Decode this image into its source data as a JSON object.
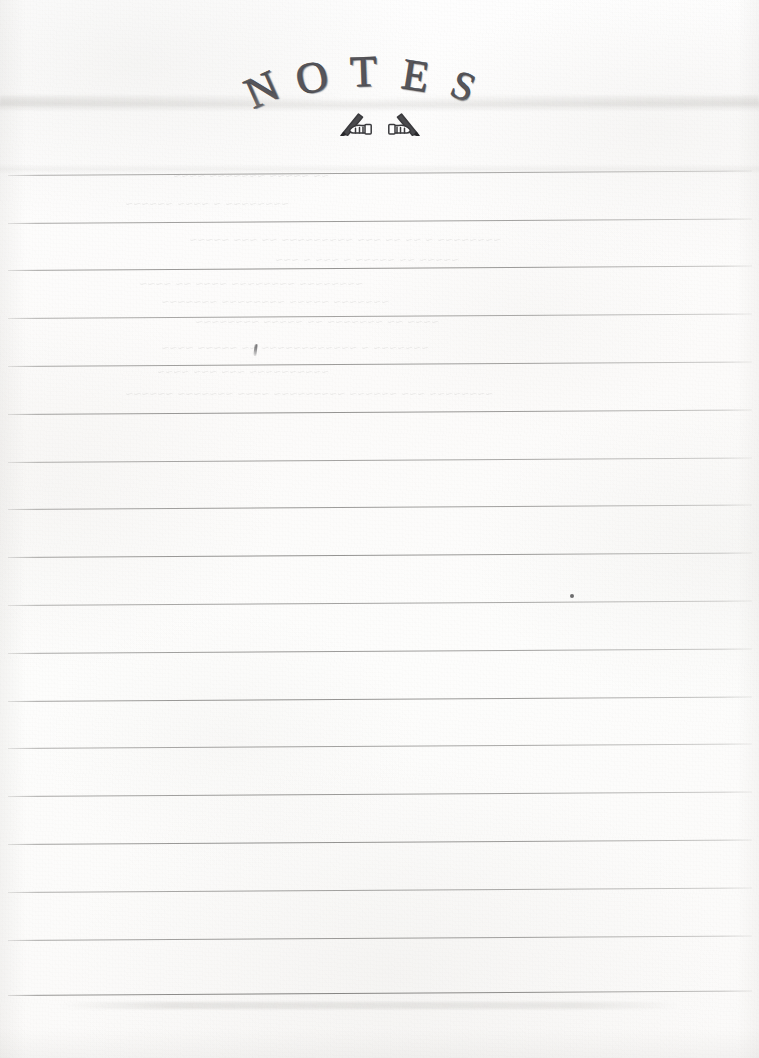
{
  "document": {
    "kind": "scanned-ruled-notepad-page",
    "title_text": "NOTES",
    "title_letters": [
      {
        "char": "N",
        "left": 6,
        "top": 20,
        "size": 44,
        "rotate": -24
      },
      {
        "char": "O",
        "left": 56,
        "top": 8,
        "size": 44,
        "rotate": -13
      },
      {
        "char": "T",
        "left": 110,
        "top": 2,
        "size": 44,
        "rotate": -2
      },
      {
        "char": "E",
        "left": 162,
        "top": 6,
        "size": 44,
        "rotate": 9
      },
      {
        "char": "S",
        "left": 212,
        "top": 18,
        "size": 40,
        "rotate": 22
      }
    ],
    "icons": [
      {
        "name": "hand-writing-pen-icon-left",
        "flipped": false
      },
      {
        "name": "hand-writing-pen-icon-right",
        "flipped": true
      }
    ],
    "page_size": {
      "width": 759,
      "height": 1058
    },
    "colors": {
      "paper": "#fdfdfc",
      "rule_line": "#6e6d6b",
      "title_ink": "#56555a",
      "title_outline": "#3f3f44",
      "stray_mark": "#484848"
    },
    "ruled_lines": {
      "count": 18,
      "first_y": 175,
      "spacing": 47.8,
      "left_x": 8,
      "right_x": 752,
      "skew_degrees": -0.35,
      "note": "faint grey printed rules, full page width, slight scan skew"
    },
    "ruled_line_tops": [
      175,
      223,
      270,
      318,
      366,
      414,
      462,
      509,
      557,
      605,
      653,
      701,
      748,
      796,
      844,
      892,
      940,
      995
    ],
    "writing_content": {
      "has_user_writing": false,
      "note": "page is blank; all lines are empty"
    },
    "artifacts": [
      {
        "name": "pen-tick-mark",
        "x": 254,
        "y": 344,
        "description": "small dark pen tick above a rule"
      },
      {
        "name": "ink-speck",
        "x": 570,
        "y": 594,
        "description": "tiny dark speck"
      },
      {
        "name": "scanner-streak-top",
        "y": 98,
        "description": "faint horizontal scanner band across the page"
      },
      {
        "name": "bottom-smudge",
        "y": 1002,
        "description": "faint grey smudge below last rule"
      }
    ],
    "showthrough": {
      "note": "faint mirrored bleed-through of handwriting from the reverse side of the sheet; illegible",
      "lines": [
        {
          "text": "~~ ~~~~~ ~~~~~~~ ~~~~",
          "x": 430,
          "y": 168,
          "size": 13
        },
        {
          "text": "~~~~~~~~ ~ ~~~~ ~~~~~~",
          "x": 470,
          "y": 196,
          "size": 13
        },
        {
          "text": "~~~~~~~~ ~ ~~ ~~ ~~~ ~~~~~~~~~ ~~ ~~~ ~~~~~",
          "x": 258,
          "y": 232,
          "size": 13
        },
        {
          "text": "~~~~~  ~~ ~~~~~ ~ ~~~ ~ ~~~",
          "x": 300,
          "y": 252,
          "size": 13
        },
        {
          "text": "~~~~~~~~  ~~~~~~~~  ~~~~ ~~ ~~~~",
          "x": 396,
          "y": 276,
          "size": 13
        },
        {
          "text": "~~~~~~~   ~~~~~ ~~~~~~~~   ~~~~~~~",
          "x": 370,
          "y": 294,
          "size": 13
        },
        {
          "text": "~~~~ ~~  ~~~~~~~ ~~  ~~~~~  ~~~~~~~~",
          "x": 320,
          "y": 314,
          "size": 13
        },
        {
          "text": "~~~~~~~ ~ ~~~~~~~~~~~~ ~~  ~~~~~   ~~~~",
          "x": 330,
          "y": 340,
          "size": 13
        },
        {
          "text": "~~~~~~~~~~ ~~~ ~~~ ~~~~",
          "x": 430,
          "y": 364,
          "size": 13
        },
        {
          "text": "~~~~~~~~  ~~~ ~~~~~~ ~~~~~~~~~ ~~~~ ~~~~~~~ ~~~~~~",
          "x": 266,
          "y": 386,
          "size": 13
        }
      ]
    }
  }
}
